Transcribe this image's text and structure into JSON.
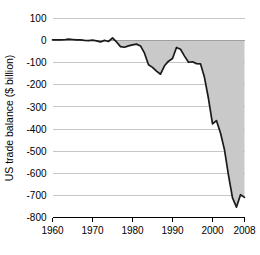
{
  "chart_data": {
    "type": "area",
    "title": "",
    "xlabel": "",
    "ylabel": "US trade balance ($ billion)",
    "xlim": [
      1960,
      2008
    ],
    "ylim": [
      -800,
      100
    ],
    "grid": true,
    "legend": "none",
    "baseline": 0,
    "fill_color": "#c9c9c9",
    "line_color": "#1a1a1a",
    "grid_color": "#b8b8b8",
    "xticks": [
      1960,
      1970,
      1980,
      1990,
      2000,
      2008
    ],
    "xtick_labels": [
      "1960",
      "1970",
      "1980",
      "1990",
      "2000",
      "2008"
    ],
    "yticks": [
      100,
      0,
      -100,
      -200,
      -300,
      -400,
      -500,
      -600,
      -700,
      -800
    ],
    "ytick_labels": [
      "100",
      "0",
      "-100",
      "-200",
      "-300",
      "-400",
      "-500",
      "-600",
      "-700",
      "-800"
    ],
    "x": [
      1960,
      1961,
      1962,
      1963,
      1964,
      1965,
      1966,
      1967,
      1968,
      1969,
      1970,
      1971,
      1972,
      1973,
      1974,
      1975,
      1976,
      1977,
      1978,
      1979,
      1980,
      1981,
      1982,
      1983,
      1984,
      1985,
      1986,
      1987,
      1988,
      1989,
      1990,
      1991,
      1992,
      1993,
      1994,
      1995,
      1996,
      1997,
      1998,
      1999,
      2000,
      2001,
      2002,
      2003,
      2004,
      2005,
      2006,
      2007,
      2008
    ],
    "values": [
      3,
      4,
      3,
      4,
      7,
      5,
      3,
      3,
      1,
      0,
      2,
      -1,
      -6,
      1,
      -4,
      12,
      -6,
      -27,
      -30,
      -24,
      -19,
      -16,
      -24,
      -57,
      -109,
      -121,
      -138,
      -152,
      -114,
      -93,
      -81,
      -31,
      -39,
      -70,
      -98,
      -96,
      -104,
      -105,
      -167,
      -263,
      -377,
      -362,
      -418,
      -494,
      -609,
      -711,
      -753,
      -697,
      -709
    ],
    "series_name": "US trade balance",
    "units": "$ billion",
    "annotations": []
  }
}
